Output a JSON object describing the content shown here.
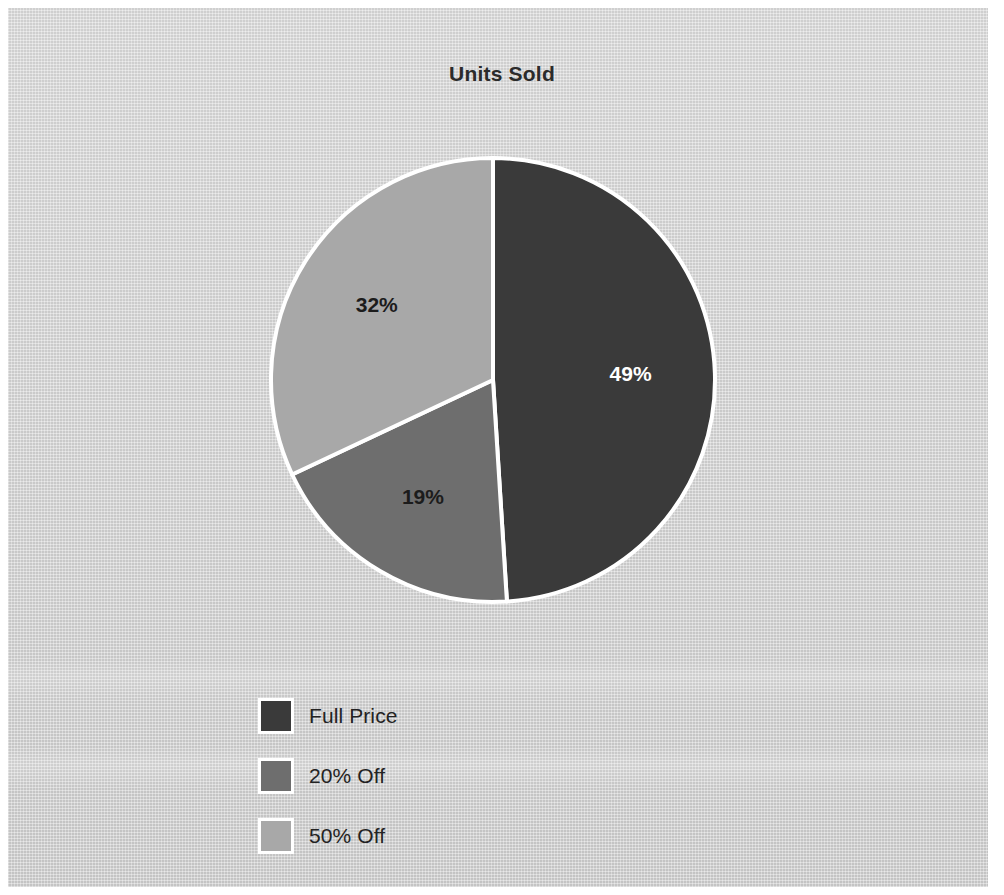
{
  "chart_data": {
    "type": "pie",
    "title": "Units Sold",
    "xlabel": "",
    "ylabel": "",
    "categories": [
      "Full Price",
      "20% Off",
      "50% Off"
    ],
    "values": [
      49,
      19,
      32
    ],
    "data_labels": [
      "49%",
      "19%",
      "32%"
    ],
    "colors": [
      "#3a3a3a",
      "#6e6e6e",
      "#a8a8a8"
    ],
    "label_colors": [
      "#ffffff",
      "#1c1c1c",
      "#1c1c1c"
    ],
    "legend_position": "bottom-left",
    "grid": false,
    "start_angle_deg": 0,
    "direction": "clockwise",
    "slice_separator_color": "#ffffff",
    "background_color": "#d3d3d3",
    "series": [
      {
        "name": "Units Sold",
        "values": [
          49,
          19,
          32
        ]
      }
    ]
  },
  "title": {
    "text": "Units Sold"
  },
  "slices": [
    {
      "label": "Full Price",
      "percent_text": "49%",
      "value": 49,
      "color": "#3a3a3a",
      "text_color": "#ffffff"
    },
    {
      "label": "20% Off",
      "percent_text": "19%",
      "value": 19,
      "color": "#6e6e6e",
      "text_color": "#1c1c1c"
    },
    {
      "label": "50% Off",
      "percent_text": "32%",
      "value": 32,
      "color": "#a8a8a8",
      "text_color": "#1c1c1c"
    }
  ],
  "legend": {
    "items": [
      {
        "label": "Full Price",
        "color": "#3a3a3a"
      },
      {
        "label": "20% Off",
        "color": "#6e6e6e"
      },
      {
        "label": "50% Off",
        "color": "#a8a8a8"
      }
    ]
  }
}
